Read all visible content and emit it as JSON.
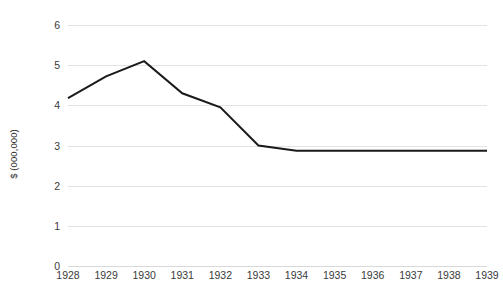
{
  "chart_data": {
    "type": "line",
    "title": "",
    "subtitle": "",
    "xlabel": "",
    "ylabel": "$ (000,000)",
    "grid": true,
    "legend": false,
    "categories": [
      "1928",
      "1929",
      "1930",
      "1931",
      "1932",
      "1933",
      "1934",
      "1935",
      "1936",
      "1937",
      "1938",
      "1939"
    ],
    "x": [
      1928,
      1929,
      1930,
      1931,
      1932,
      1933,
      1934,
      1935,
      1936,
      1937,
      1938,
      1939
    ],
    "values": [
      4.18,
      4.72,
      5.1,
      4.3,
      3.95,
      3.0,
      2.87,
      2.87,
      2.87,
      2.87,
      2.87,
      2.87
    ],
    "series": [
      {
        "name": "",
        "color": "#1a1a1a",
        "values": [
          4.18,
          4.72,
          5.1,
          4.3,
          3.95,
          3.0,
          2.87,
          2.87,
          2.87,
          2.87,
          2.87,
          2.87
        ]
      }
    ],
    "ylim": [
      0,
      6
    ],
    "yticks": [
      0,
      1,
      2,
      3,
      4,
      5,
      6
    ],
    "ytick_labels": [
      "0",
      "1",
      "2",
      "3",
      "4",
      "5",
      "6"
    ],
    "xlim": [
      1928,
      1939
    ],
    "colors": {
      "line": "#1a1a1a",
      "gridline": "#e3e3e3",
      "baseline": "#d9d9d9",
      "text": "#3a3a3a",
      "background": "#ffffff"
    }
  }
}
